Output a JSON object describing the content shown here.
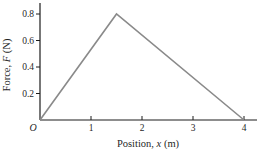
{
  "figure": {
    "background": "#ffffff",
    "origin_label": "O"
  },
  "chart_data": {
    "type": "line",
    "title": "",
    "xlabel": "Position, x (m)",
    "ylabel": "Force, F (N)",
    "xlabel_parts": {
      "prefix": "Position, ",
      "symbol": "x",
      "suffix": " (m)"
    },
    "ylabel_parts": {
      "prefix": "Force, ",
      "symbol": "F",
      "suffix": " (N)"
    },
    "x_ticks": [
      1,
      2,
      3,
      4
    ],
    "y_ticks": [
      0.2,
      0.4,
      0.6,
      0.8
    ],
    "xlim": [
      0,
      4.25
    ],
    "ylim": [
      0,
      0.88
    ],
    "grid": false,
    "legend": "none",
    "series": [
      {
        "name": "force-vs-position",
        "x": [
          0,
          1.5,
          4
        ],
        "y": [
          0,
          0.8,
          0
        ]
      }
    ],
    "line_color": "#8a8a8a",
    "axis_color": "#1c1c1c",
    "text_color": "#1f1f1f"
  }
}
